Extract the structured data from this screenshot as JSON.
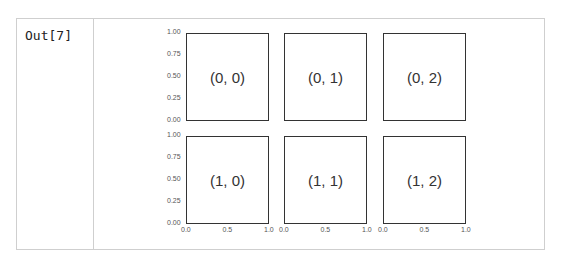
{
  "cell": {
    "prompt": "Out[7]"
  },
  "chart_data": {
    "type": "subplots_grid",
    "rows": 2,
    "cols": 3,
    "subplots": [
      {
        "row": 0,
        "col": 0,
        "label": "(0, 0)"
      },
      {
        "row": 0,
        "col": 1,
        "label": "(0, 1)"
      },
      {
        "row": 0,
        "col": 2,
        "label": "(0, 2)"
      },
      {
        "row": 1,
        "col": 0,
        "label": "(1, 0)"
      },
      {
        "row": 1,
        "col": 1,
        "label": "(1, 1)"
      },
      {
        "row": 1,
        "col": 2,
        "label": "(1, 2)"
      }
    ],
    "sharex": true,
    "sharey": true,
    "xlim": [
      0,
      1
    ],
    "ylim": [
      0,
      1
    ],
    "yticks": [
      "1.00",
      "0.75",
      "0.50",
      "0.25",
      "0.00"
    ],
    "xticks": [
      "0.0",
      "0.5",
      "1.0"
    ]
  }
}
